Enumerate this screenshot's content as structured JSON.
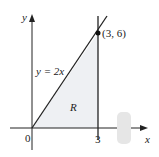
{
  "diagram": {
    "axis_x_label": "x",
    "axis_y_label": "y",
    "origin_label": "0",
    "tick_x_label": "3",
    "line_label": "y = 2x",
    "point_label": "(3, 6)",
    "region_label": "R",
    "colors": {
      "region": "#f1f2f4",
      "lines": "#222222"
    }
  }
}
